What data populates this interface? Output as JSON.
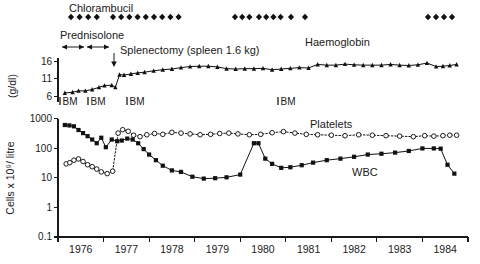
{
  "chart_data": {
    "type": "line",
    "title": "",
    "xlabel": "",
    "x_tick_labels": [
      "1976",
      "1977",
      "1978",
      "1979",
      "1980",
      "1981",
      "1982",
      "1983",
      "1984"
    ],
    "x_range": [
      1975.6,
      1984.6
    ],
    "grid": false,
    "legend_position": "inline-labels",
    "panels": [
      {
        "name": "haemoglobin-panel",
        "ylabel": "(g/dl)",
        "y_tick_labels": [
          "16",
          "11",
          "6"
        ],
        "y_ticks": [
          16,
          11,
          6
        ],
        "ylim": [
          5,
          17.5
        ],
        "scale": "linear",
        "series": [
          {
            "name": "Haemoglobin",
            "marker": "filled-triangle",
            "line": "solid",
            "x": [
              1975.75,
              1975.92,
              1976.05,
              1976.2,
              1976.35,
              1976.5,
              1976.62,
              1976.78,
              1976.86,
              1976.95,
              1977.05,
              1977.2,
              1977.35,
              1977.5,
              1977.7,
              1977.9,
              1978.1,
              1978.3,
              1978.5,
              1978.7,
              1978.9,
              1979.1,
              1979.3,
              1979.5,
              1979.7,
              1979.9,
              1980.1,
              1980.3,
              1980.5,
              1980.7,
              1980.9,
              1981.1,
              1981.3,
              1981.5,
              1981.7,
              1981.9,
              1982.1,
              1982.3,
              1982.5,
              1982.7,
              1982.9,
              1983.1,
              1983.3,
              1983.5,
              1983.7,
              1983.9,
              1984.05,
              1984.2,
              1984.35
            ],
            "y": [
              7.0,
              7.2,
              7.6,
              7.6,
              8.0,
              8.6,
              9.1,
              9.2,
              8.6,
              12.2,
              12.1,
              12.4,
              12.7,
              12.9,
              13.3,
              13.6,
              13.8,
              14.2,
              14.5,
              14.6,
              14.6,
              14.4,
              13.9,
              13.8,
              13.9,
              13.9,
              14.0,
              13.6,
              13.8,
              14.0,
              14.2,
              14.1,
              15.1,
              14.9,
              14.9,
              15.2,
              15.0,
              14.9,
              14.9,
              14.9,
              15.1,
              14.9,
              14.8,
              15.0,
              15.5,
              14.5,
              14.6,
              14.8,
              15.1
            ]
          }
        ]
      },
      {
        "name": "cell-counts-panel",
        "ylabel": "Cells x 10⁹/ litre",
        "y_tick_labels": [
          "1000",
          "100",
          "10",
          "1",
          "0.1"
        ],
        "y_ticks": [
          1000,
          100,
          10,
          1,
          0.1
        ],
        "ylim": [
          0.1,
          2000
        ],
        "scale": "log",
        "series": [
          {
            "name": "Platelets",
            "marker": "open-circle",
            "line": "dotted",
            "x": [
              1975.78,
              1975.86,
              1975.95,
              1976.05,
              1976.15,
              1976.25,
              1976.35,
              1976.45,
              1976.55,
              1976.68,
              1976.8,
              1976.92,
              1977.02,
              1977.14,
              1977.26,
              1977.4,
              1977.55,
              1977.72,
              1977.9,
              1978.1,
              1978.3,
              1978.5,
              1978.72,
              1978.95,
              1979.15,
              1979.35,
              1979.55,
              1979.8,
              1980.05,
              1980.3,
              1980.55,
              1980.8,
              1981.05,
              1981.3,
              1981.6,
              1981.9,
              1982.2,
              1982.5,
              1982.8,
              1983.1,
              1983.4,
              1983.65,
              1983.85,
              1984.05,
              1984.2,
              1984.35
            ],
            "y": [
              30,
              33,
              40,
              44,
              36,
              28,
              24,
              20,
              16,
              14,
              17,
              330,
              430,
              380,
              280,
              250,
              290,
              320,
              300,
              350,
              330,
              310,
              290,
              300,
              320,
              330,
              310,
              290,
              300,
              340,
              370,
              330,
              300,
              290,
              280,
              270,
              290,
              280,
              270,
              260,
              250,
              270,
              260,
              270,
              280,
              280
            ]
          },
          {
            "name": "WBC",
            "marker": "filled-square",
            "line": "solid",
            "x": [
              1975.75,
              1975.85,
              1975.95,
              1976.05,
              1976.15,
              1976.25,
              1976.35,
              1976.45,
              1976.55,
              1976.65,
              1976.78,
              1976.9,
              1977.0,
              1977.12,
              1977.24,
              1977.36,
              1977.48,
              1977.6,
              1977.75,
              1977.9,
              1978.1,
              1978.3,
              1978.55,
              1978.8,
              1979.05,
              1979.3,
              1979.6,
              1979.9,
              1980.0,
              1980.15,
              1980.3,
              1980.5,
              1980.7,
              1980.95,
              1981.2,
              1981.5,
              1981.8,
              1982.1,
              1982.4,
              1982.7,
              1983.0,
              1983.3,
              1983.6,
              1983.85,
              1984.0,
              1984.15,
              1984.3
            ],
            "y": [
              620,
              600,
              560,
              420,
              330,
              260,
              200,
              150,
              230,
              110,
              200,
              175,
              185,
              215,
              200,
              150,
              95,
              62,
              40,
              26,
              18,
              16,
              11,
              9.5,
              9.8,
              10.5,
              13,
              150,
              150,
              45,
              30,
              22,
              23,
              27,
              33,
              40,
              45,
              52,
              62,
              66,
              72,
              82,
              100,
              100,
              98,
              28,
              14
            ]
          }
        ]
      }
    ],
    "annotations": {
      "treatments": [
        {
          "name": "Chlorambucil",
          "label": "Chlorambucil",
          "marker": "diamond",
          "row_y_px": 17,
          "clusters": [
            {
              "count": 4,
              "x_start_px": 71,
              "spacing_px": 8.6
            },
            {
              "count": 9,
              "x_start_px": 113,
              "spacing_px": 8.2
            },
            {
              "count": 3,
              "x_start_px": 235,
              "spacing_px": 7.2
            },
            {
              "count": 4,
              "x_start_px": 259,
              "spacing_px": 7.2
            },
            {
              "count": 1,
              "x_start_px": 291,
              "spacing_px": 0
            },
            {
              "count": 1,
              "x_start_px": 305,
              "spacing_px": 0
            },
            {
              "count": 4,
              "x_start_px": 428,
              "spacing_px": 8.0
            }
          ]
        },
        {
          "name": "Prednisolone",
          "label": "Prednisolone",
          "marker": "double-headed-arrow",
          "segments": [
            {
              "x1_px": 62,
              "x2_px": 84
            },
            {
              "x1_px": 87,
              "x2_px": 109
            }
          ],
          "row_y_px": 47
        }
      ],
      "events": [
        {
          "name": "Splenectomy",
          "label": "Splenectomy (spleen 1.6 kg)",
          "marker": "down-arrow",
          "arrow_x_px": 114,
          "label_x_px": 120,
          "label_y_px": 50
        }
      ],
      "bone_marrow": {
        "label": "BM",
        "marker": "vertical-tick",
        "positions_px": [
          60,
          88,
          127,
          278
        ]
      },
      "series_labels": [
        {
          "name": "Haemoglobin",
          "text": "Haemoglobin",
          "x_px": 305,
          "y_px": 46
        },
        {
          "name": "Platelets",
          "text": "Platelets",
          "x_px": 310,
          "y_px": 124
        },
        {
          "name": "WBC",
          "text": "WBC",
          "x_px": 355,
          "y_px": 172
        }
      ]
    }
  },
  "colors": {
    "ink": "#111111",
    "background": "#ffffff"
  }
}
